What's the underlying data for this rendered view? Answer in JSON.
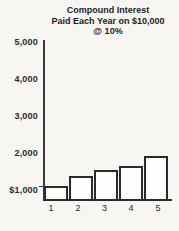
{
  "figure": {
    "background_color": "#f7f6f3",
    "axis_color": "#3a3a3a",
    "text_color": "#1c1c1c"
  },
  "chart_data": {
    "type": "bar",
    "title": "Compound Interest Paid Each Year on $10,000 @ 10%",
    "title_lines": [
      "Compound Interest",
      "Paid Each Year on $10,000",
      "@ 10%"
    ],
    "xlabel": "",
    "ylabel": "",
    "categories": [
      "1",
      "2",
      "3",
      "4",
      "5"
    ],
    "values": [
      1000,
      1280,
      1440,
      1550,
      1800
    ],
    "y_ticks": [
      {
        "label": "5,000",
        "value": 5000
      },
      {
        "label": "4,000",
        "value": 4000
      },
      {
        "label": "3,000",
        "value": 3000
      },
      {
        "label": "2,000",
        "value": 2000
      },
      {
        "label": "$1,000",
        "value": 1000
      }
    ],
    "ylim": [
      650,
      5150
    ],
    "grid": false,
    "legend": false,
    "bar_fill": "#fdfdfb",
    "bar_border": "#2b2b2b"
  }
}
